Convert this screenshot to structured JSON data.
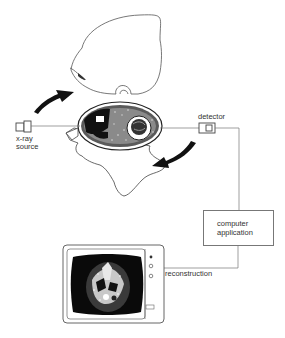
{
  "diagram": {
    "labels": {
      "xray_source_line1": "x-ray",
      "xray_source_line2": "source",
      "detector": "detector",
      "computer_line1": "computer",
      "computer_line2": "application",
      "reconstruction": "reconstruction"
    },
    "colors": {
      "line": "#777777",
      "ink": "#1a1a1a",
      "screen": "#0a0a0a",
      "background": "#ffffff"
    },
    "nodes": [
      {
        "id": "head-outline",
        "kind": "illustration"
      },
      {
        "id": "head-cross-section",
        "kind": "illustration"
      },
      {
        "id": "xray-source",
        "kind": "device"
      },
      {
        "id": "detector",
        "kind": "device"
      },
      {
        "id": "computer-application",
        "kind": "box"
      },
      {
        "id": "monitor",
        "kind": "display"
      }
    ],
    "edges": [
      {
        "from": "xray-source",
        "to": "head-cross-section"
      },
      {
        "from": "head-cross-section",
        "to": "detector"
      },
      {
        "from": "detector",
        "to": "computer-application"
      },
      {
        "from": "computer-application",
        "to": "monitor",
        "label": "reconstruction"
      }
    ],
    "arrows": [
      {
        "id": "rotation-arrow-up",
        "direction": "up-right"
      },
      {
        "id": "rotation-arrow-down",
        "direction": "down-left"
      }
    ]
  }
}
